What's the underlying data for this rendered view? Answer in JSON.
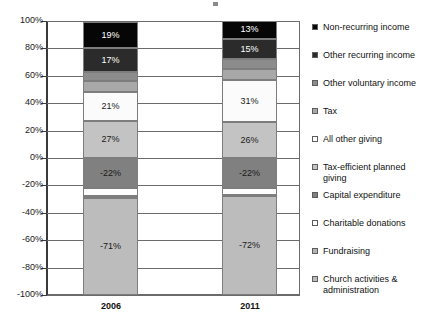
{
  "chart_data": {
    "type": "bar",
    "subtype": "stacked-diverging",
    "title": "",
    "xlabel": "",
    "ylabel": "",
    "categories": [
      "2006",
      "2011"
    ],
    "ylim": [
      -100,
      100
    ],
    "ytick_labels": [
      "100%",
      "80%",
      "60%",
      "40%",
      "20%",
      "0%",
      "-20%",
      "-40%",
      "-60%",
      "-80%",
      "-100%"
    ],
    "ytick_values": [
      100,
      80,
      60,
      40,
      20,
      0,
      -20,
      -40,
      -60,
      -80,
      -100
    ],
    "grid": true,
    "legend_position": "right",
    "series": [
      {
        "name": "Non-recurring income",
        "color": "#060606",
        "label_color": "light",
        "values": [
          19,
          13
        ],
        "labels": [
          "19%",
          "13%"
        ]
      },
      {
        "name": "Other recurring income",
        "color": "#2b2b2b",
        "label_color": "light",
        "values": [
          17,
          15
        ],
        "labels": [
          "17%",
          "15%"
        ]
      },
      {
        "name": "Other voluntary income",
        "color": "#8c8c8c",
        "label_color": "dark",
        "values": [
          7,
          7
        ],
        "labels": [
          "7%",
          "7%"
        ]
      },
      {
        "name": "Tax",
        "color": "#a8a8a8",
        "label_color": "dark",
        "values": [
          8,
          8
        ],
        "labels": [
          "8%",
          "8%"
        ]
      },
      {
        "name": "All other giving",
        "color": "#fbfbfb",
        "label_color": "dark",
        "values": [
          21,
          31
        ],
        "labels": [
          "21%",
          "31%"
        ]
      },
      {
        "name": "Tax-efficient planned giving",
        "color": "#c3c3c3",
        "label_color": "dark",
        "values": [
          27,
          26
        ],
        "labels": [
          "27%",
          "26%"
        ]
      },
      {
        "name": "Capital expenditure",
        "color": "#808080",
        "label_color": "dark",
        "values": [
          -22,
          -22
        ],
        "labels": [
          "-22%",
          "-22%"
        ]
      },
      {
        "name": "Charitable donations",
        "color": "#fdfdfd",
        "label_color": "dark",
        "values": [
          -6,
          -5
        ],
        "labels": [
          "-6%",
          "-5%"
        ]
      },
      {
        "name": "Fundraising",
        "color": "#b4b4b4",
        "label_color": "dark",
        "values": [
          -1,
          -1
        ],
        "labels": [
          "-1%",
          "-1%"
        ]
      },
      {
        "name": "Church activities & administration",
        "color": "#bcbcbc",
        "label_color": "dark",
        "values": [
          -71,
          -72
        ],
        "labels": [
          "-71%",
          "-72%"
        ]
      }
    ]
  },
  "legend": {
    "items": [
      {
        "label": "Non-recurring income"
      },
      {
        "label": "Other recurring income"
      },
      {
        "label": "Other voluntary income"
      },
      {
        "label": "Tax"
      },
      {
        "label": "All other giving"
      },
      {
        "label": "Tax-efficient planned giving"
      },
      {
        "label": "Capital expenditure"
      },
      {
        "label": "Charitable donations"
      },
      {
        "label": "Fundraising"
      },
      {
        "label": "Church activities & administration"
      }
    ]
  }
}
